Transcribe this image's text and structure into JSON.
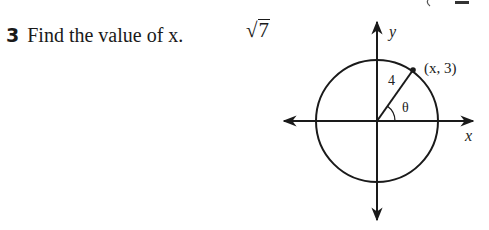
{
  "problem": {
    "number": "3",
    "text": "Find the value of x.",
    "answer": {
      "radical_symbol": "√",
      "radicand": "7"
    }
  },
  "diagram": {
    "type": "unit-circle-style",
    "axis_labels": {
      "x": "x",
      "y": "y"
    },
    "point_label": "(x, 3)",
    "radius_label": "4",
    "angle_label": "θ",
    "center": [
      377,
      121
    ],
    "radius_px": 61,
    "point": [
      413,
      70
    ]
  },
  "colors": {
    "ink": "#1a1a1a",
    "background": "#ffffff"
  }
}
